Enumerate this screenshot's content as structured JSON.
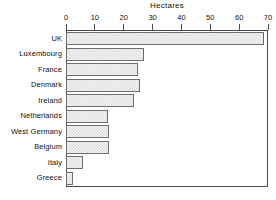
{
  "chart_data": {
    "type": "bar",
    "orientation": "horizontal",
    "title": "Hectares",
    "xlabel": "",
    "ylabel": "",
    "xlim": [
      0,
      70
    ],
    "xticks": [
      0,
      10,
      20,
      30,
      40,
      50,
      60,
      70
    ],
    "xtick_labels": [
      "0",
      "10",
      "20",
      "30",
      "40",
      "50",
      "60",
      "70"
    ],
    "grid": false,
    "legend": false,
    "categories": [
      "UK",
      "Luxembourg",
      "France",
      "Denmark",
      "Ireland",
      "Netherlands",
      "West Germany",
      "Belgium",
      "Italy",
      "Greece"
    ],
    "values": [
      68.5,
      27,
      25,
      25.5,
      23.5,
      14.5,
      14.8,
      15,
      6,
      2.5
    ],
    "bar_fill_color": "#f2f2f2",
    "bar_edge_color": "#6e6e6e",
    "axis_color": "#4a4a4a",
    "background_color": "#ffffff"
  }
}
